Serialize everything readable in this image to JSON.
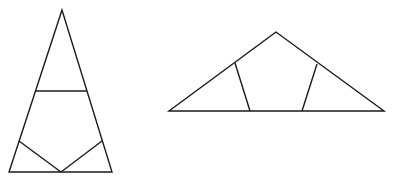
{
  "figure": {
    "stroke_color": "#1a1a1a",
    "caption": ""
  },
  "shapes": {
    "left_triangle": {
      "outline": [
        [
          62,
          10
        ],
        [
          9,
          172
        ],
        [
          112,
          172
        ]
      ],
      "cuts": [
        [
          [
            36,
            91
          ],
          [
            87,
            91
          ]
        ],
        [
          [
            19,
            141
          ],
          [
            61,
            172
          ]
        ],
        [
          [
            61,
            172
          ],
          [
            102,
            141
          ]
        ]
      ]
    },
    "right_triangle": {
      "outline": [
        [
          276,
          32
        ],
        [
          169,
          111
        ],
        [
          384,
          111
        ]
      ],
      "cuts": [
        [
          [
            235,
            63
          ],
          [
            250,
            111
          ]
        ],
        [
          [
            317,
            64
          ],
          [
            302,
            111
          ]
        ]
      ]
    }
  }
}
